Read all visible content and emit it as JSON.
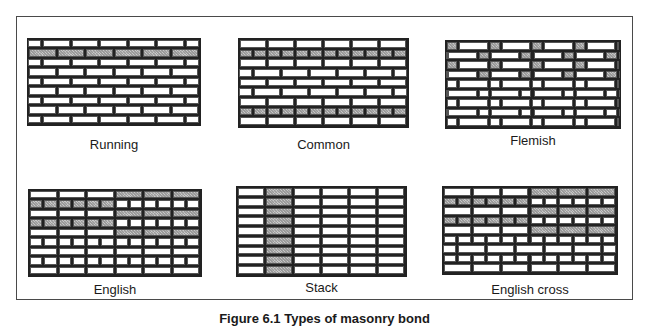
{
  "figure": {
    "caption": "Figure 6.1 Types of masonry bond",
    "panels": [
      {
        "id": "running",
        "label": "Running",
        "wall": {
          "x": 27,
          "y": 38,
          "w": 174,
          "h": 88
        },
        "label_pos": {
          "x": 27,
          "y": 137,
          "w": 174
        },
        "courses": [
          {
            "pattern": "stretcher",
            "offset": 0.5,
            "shaded": []
          },
          {
            "pattern": "stretcher",
            "offset": 0,
            "shaded": "all"
          },
          {
            "pattern": "stretcher",
            "offset": 0.5,
            "shaded": []
          },
          {
            "pattern": "stretcher",
            "offset": 0,
            "shaded": []
          },
          {
            "pattern": "stretcher",
            "offset": 0.5,
            "shaded": []
          },
          {
            "pattern": "stretcher",
            "offset": 0,
            "shaded": []
          },
          {
            "pattern": "stretcher",
            "offset": 0.5,
            "shaded": []
          },
          {
            "pattern": "stretcher",
            "offset": 0,
            "shaded": []
          },
          {
            "pattern": "stretcher",
            "offset": 0.5,
            "shaded": []
          }
        ]
      },
      {
        "id": "common",
        "label": "Common",
        "wall": {
          "x": 238,
          "y": 38,
          "w": 171,
          "h": 90
        },
        "label_pos": {
          "x": 238,
          "y": 137,
          "w": 171
        },
        "courses": [
          {
            "pattern": "stretcher",
            "offset": 0,
            "shaded": []
          },
          {
            "pattern": "header",
            "offset": 0,
            "shaded": "all"
          },
          {
            "pattern": "stretcher",
            "offset": 0,
            "shaded": []
          },
          {
            "pattern": "stretcher",
            "offset": 0.5,
            "shaded": []
          },
          {
            "pattern": "stretcher",
            "offset": 0,
            "shaded": []
          },
          {
            "pattern": "stretcher",
            "offset": 0.5,
            "shaded": []
          },
          {
            "pattern": "stretcher",
            "offset": 0,
            "shaded": []
          },
          {
            "pattern": "header",
            "offset": 0,
            "shaded": "all"
          },
          {
            "pattern": "stretcher",
            "offset": 0,
            "shaded": []
          }
        ]
      },
      {
        "id": "flemish",
        "label": "Flemish",
        "wall": {
          "x": 445,
          "y": 40,
          "w": 176,
          "h": 89
        },
        "label_pos": {
          "x": 445,
          "y": 133,
          "w": 176
        },
        "courses": [
          {
            "pattern": "flemish",
            "offset": 0,
            "shaded": "headers"
          },
          {
            "pattern": "flemish",
            "offset": 0.5,
            "shaded": "headers"
          },
          {
            "pattern": "flemish",
            "offset": 0,
            "shaded": "headers"
          },
          {
            "pattern": "flemish",
            "offset": 0.5,
            "shaded": "headers"
          },
          {
            "pattern": "flemish",
            "offset": 0,
            "shaded": []
          },
          {
            "pattern": "flemish",
            "offset": 0.5,
            "shaded": []
          },
          {
            "pattern": "flemish",
            "offset": 0,
            "shaded": []
          },
          {
            "pattern": "flemish",
            "offset": 0.5,
            "shaded": []
          },
          {
            "pattern": "flemish",
            "offset": 0,
            "shaded": []
          }
        ]
      },
      {
        "id": "english",
        "label": "English",
        "wall": {
          "x": 28,
          "y": 189,
          "w": 174,
          "h": 88
        },
        "label_pos": {
          "x": 28,
          "y": 282,
          "w": 174
        },
        "courses": [
          {
            "pattern": "stretcher",
            "offset": 0,
            "shaded": "right-half"
          },
          {
            "pattern": "header",
            "offset": 0,
            "shaded": "left-half"
          },
          {
            "pattern": "stretcher",
            "offset": 0,
            "shaded": "right-half"
          },
          {
            "pattern": "header",
            "offset": 0,
            "shaded": "left-half"
          },
          {
            "pattern": "stretcher",
            "offset": 0,
            "shaded": "right-half"
          },
          {
            "pattern": "header",
            "offset": 0,
            "shaded": []
          },
          {
            "pattern": "stretcher",
            "offset": 0,
            "shaded": []
          },
          {
            "pattern": "header",
            "offset": 0,
            "shaded": []
          },
          {
            "pattern": "stretcher",
            "offset": 0,
            "shaded": []
          }
        ]
      },
      {
        "id": "stack",
        "label": "Stack",
        "wall": {
          "x": 236,
          "y": 186,
          "w": 171,
          "h": 91
        },
        "label_pos": {
          "x": 236,
          "y": 280,
          "w": 171
        },
        "courses": [
          {
            "pattern": "stack",
            "offset": 0,
            "shaded": [
              1
            ]
          },
          {
            "pattern": "stack",
            "offset": 0,
            "shaded": [
              1
            ]
          },
          {
            "pattern": "stack",
            "offset": 0,
            "shaded": [
              1
            ]
          },
          {
            "pattern": "stack",
            "offset": 0,
            "shaded": [
              1
            ]
          },
          {
            "pattern": "stack",
            "offset": 0,
            "shaded": [
              1
            ]
          },
          {
            "pattern": "stack",
            "offset": 0,
            "shaded": [
              1
            ]
          },
          {
            "pattern": "stack",
            "offset": 0,
            "shaded": [
              1
            ]
          },
          {
            "pattern": "stack",
            "offset": 0,
            "shaded": [
              1
            ]
          },
          {
            "pattern": "stack",
            "offset": 0,
            "shaded": [
              1
            ]
          }
        ]
      },
      {
        "id": "english-cross",
        "label": "English cross",
        "wall": {
          "x": 442,
          "y": 186,
          "w": 176,
          "h": 89
        },
        "label_pos": {
          "x": 442,
          "y": 282,
          "w": 176
        },
        "courses": [
          {
            "pattern": "stretcher",
            "offset": 0,
            "shaded": "right-half"
          },
          {
            "pattern": "header",
            "offset": 0,
            "shaded": "left-half"
          },
          {
            "pattern": "stretcher",
            "offset": 0,
            "shaded": "right-half"
          },
          {
            "pattern": "header",
            "offset": 0,
            "shaded": "left-half"
          },
          {
            "pattern": "stretcher",
            "offset": 0,
            "shaded": "right-half"
          },
          {
            "pattern": "header",
            "offset": 0,
            "shaded": []
          },
          {
            "pattern": "stretcher",
            "offset": 0.5,
            "shaded": []
          },
          {
            "pattern": "header",
            "offset": 0,
            "shaded": []
          },
          {
            "pattern": "stretcher",
            "offset": 0,
            "shaded": []
          }
        ]
      }
    ]
  },
  "colors": {
    "mortar": "#222222",
    "brick": "#ffffff",
    "shaded_brick": "#c8c8c8",
    "frame": "#4a4a4a"
  }
}
